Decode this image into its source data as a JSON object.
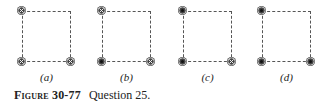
{
  "figure": {
    "number_label": "Figure 30-77",
    "caption": "Question 25.",
    "panels": [
      {
        "label": "(a)",
        "left": 22,
        "markers": {
          "top_left": "into",
          "bottom_left": "into",
          "bottom_right": "into"
        }
      },
      {
        "label": "(b)",
        "left": 102,
        "markers": {
          "top_left": "into",
          "bottom_left": "out",
          "bottom_right": "into"
        }
      },
      {
        "label": "(c)",
        "left": 183,
        "markers": {
          "top_left": "out",
          "bottom_left": "out",
          "bottom_right": "into"
        }
      },
      {
        "label": "(d)",
        "left": 262,
        "markers": {
          "top_left": "out",
          "bottom_left": "out",
          "bottom_right": "out"
        }
      }
    ],
    "legend": {
      "into": "current into page (⊗)",
      "out": "current out of page (⊙)"
    },
    "colors": {
      "marker": "#444444",
      "dash": "#555555"
    }
  }
}
